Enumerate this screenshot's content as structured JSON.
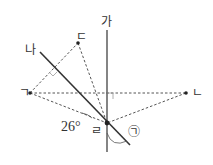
{
  "diagram": {
    "lines": {
      "ga": {
        "label": "가",
        "x1": 107,
        "y1": 30,
        "x2": 107,
        "y2": 152
      },
      "na": {
        "label": "나",
        "x1": 40,
        "y1": 52,
        "x2": 130,
        "y2": 145
      }
    },
    "points": {
      "giyeok": {
        "label": "ㄱ",
        "x": 30,
        "y": 93
      },
      "nieun": {
        "label": "ㄴ",
        "x": 186,
        "y": 93
      },
      "digeut": {
        "label": "ㄷ",
        "x": 78,
        "y": 43
      },
      "rieul": {
        "label": "ㄹ",
        "x": 107,
        "y": 123
      }
    },
    "angle_label": "26°",
    "marked_angle_label": "㉠",
    "colors": {
      "line": "#333333",
      "dashed": "#555555",
      "right_angle": "#999999"
    }
  }
}
